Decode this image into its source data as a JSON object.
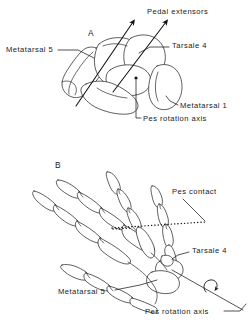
{
  "figure": {
    "background_color": "#ffffff",
    "ink_color": "#1a1a1a",
    "width": 252,
    "height": 327
  },
  "panels": [
    {
      "letter": "A",
      "view": "proximal tarsal / metatarsal block, stippled three-dimensional rendering",
      "labels": [
        {
          "id": "pedal-extensors",
          "text": "Pedal extensors",
          "x": 147,
          "y": 12
        },
        {
          "id": "metatarsal-5",
          "text": "Metatarsal 5",
          "x": 6,
          "y": 50
        },
        {
          "id": "tarsale-4",
          "text": "Tarsale 4",
          "x": 172,
          "y": 46
        },
        {
          "id": "metatarsal-1",
          "text": "Metatarsal 1",
          "x": 180,
          "y": 106
        },
        {
          "id": "pes-rotation-axis",
          "text": "Pes rotation axis",
          "x": 143,
          "y": 122
        }
      ]
    },
    {
      "letter": "B",
      "view": "dorsal skeletal outline of pes with digits and phalanges",
      "labels": [
        {
          "id": "pes-contact",
          "text": "Pes contact",
          "x": 172,
          "y": 192
        },
        {
          "id": "tarsale-4",
          "text": "Tarsale 4",
          "x": 192,
          "y": 252
        },
        {
          "id": "metatarsal-5",
          "text": "Metatarsal 5",
          "x": 58,
          "y": 293
        },
        {
          "id": "pes-rotation-axis",
          "text": "Pes rotation axis",
          "x": 145,
          "y": 312
        }
      ]
    }
  ],
  "annotations": {
    "arrow_count_panel_a": 2,
    "arrow_direction": "up-right",
    "rotation_marker": "curved-arrow",
    "contact_line_style": "dotted"
  }
}
